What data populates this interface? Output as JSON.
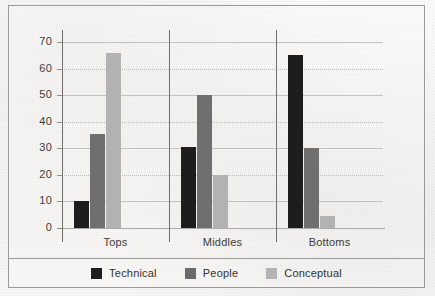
{
  "chart_data": {
    "type": "bar",
    "title": "",
    "xlabel": "",
    "ylabel": "",
    "categories": [
      "Tops",
      "Middles",
      "Bottoms"
    ],
    "series": [
      {
        "name": "Technical",
        "color": "#1d1d1d",
        "values": [
          10,
          30.5,
          65
        ]
      },
      {
        "name": "People",
        "color": "#6f6f6f",
        "values": [
          35.5,
          50,
          30
        ]
      },
      {
        "name": "Conceptual",
        "color": "#b2b2b2",
        "values": [
          66,
          20,
          4.5
        ]
      }
    ],
    "ylim": [
      0,
      70
    ],
    "ytick_labels": [
      "70",
      "60",
      "50",
      "40",
      "30",
      "20",
      "10",
      "0"
    ],
    "ytick_values": [
      70,
      60,
      50,
      40,
      30,
      20,
      10,
      0
    ],
    "grid": true,
    "grid_axis": "y",
    "legend_position": "bottom"
  },
  "legend": {
    "items": [
      {
        "label": "Technical",
        "swatch": "technical"
      },
      {
        "label": "People",
        "swatch": "people"
      },
      {
        "label": "Conceptual",
        "swatch": "conceptual"
      }
    ]
  }
}
